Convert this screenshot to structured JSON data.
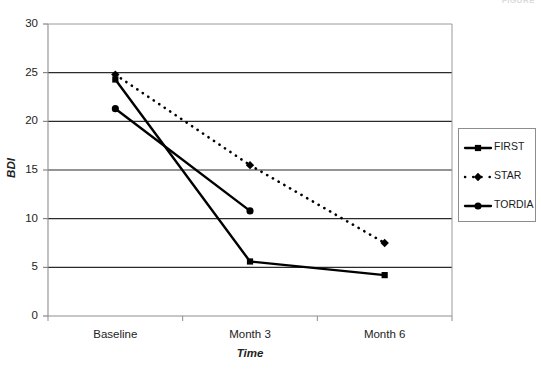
{
  "header_fragment": "FIGURE",
  "chart_data": {
    "type": "line",
    "title": "",
    "xlabel": "Time",
    "ylabel": "BDI",
    "categories": [
      "Baseline",
      "Month 3",
      "Month 6"
    ],
    "ylim": [
      0,
      30
    ],
    "yticks": [
      0,
      5,
      10,
      15,
      20,
      25,
      30
    ],
    "ytick_labels": [
      "0",
      "5",
      "10",
      "15",
      "20",
      "25",
      "30"
    ],
    "grid": "horizontal",
    "legend_position": "right-outside",
    "series": [
      {
        "name": "FIRST",
        "marker": "square",
        "linestyle": "solid",
        "color": "#000000",
        "values": [
          24.3,
          5.6,
          4.2
        ]
      },
      {
        "name": "STAR",
        "marker": "diamond",
        "linestyle": "dotted",
        "color": "#000000",
        "values": [
          24.8,
          15.5,
          7.5
        ]
      },
      {
        "name": "TORDIA",
        "marker": "circle",
        "linestyle": "solid",
        "color": "#000000",
        "values": [
          21.3,
          10.8,
          null
        ]
      }
    ]
  },
  "legend": {
    "items": [
      {
        "label": "FIRST"
      },
      {
        "label": "STAR"
      },
      {
        "label": "TORDIA"
      }
    ]
  },
  "axes": {
    "y_title": "BDI",
    "x_title": "Time"
  }
}
